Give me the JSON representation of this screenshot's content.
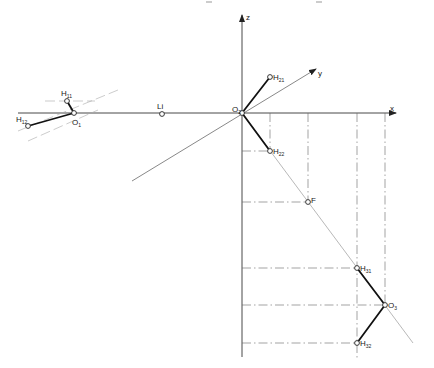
{
  "figure": {
    "type": "descriptive-geometry-construction",
    "axes": {
      "x": {
        "label": "x"
      },
      "y": {
        "label": "y"
      },
      "z": {
        "label": "z"
      }
    },
    "points": [
      {
        "id": "O2",
        "label": "O",
        "sub": "2",
        "x": 242,
        "y": 113
      },
      {
        "id": "H21",
        "label": "H",
        "sub": "21",
        "x": 270,
        "y": 77
      },
      {
        "id": "H22",
        "label": "H",
        "sub": "22",
        "x": 270,
        "y": 151
      },
      {
        "id": "F",
        "label": "F",
        "sub": "",
        "x": 308,
        "y": 202
      },
      {
        "id": "H31",
        "label": "H",
        "sub": "31",
        "x": 357,
        "y": 268
      },
      {
        "id": "O3",
        "label": "O",
        "sub": "3",
        "x": 385,
        "y": 305
      },
      {
        "id": "H32",
        "label": "H",
        "sub": "32",
        "x": 357,
        "y": 343
      },
      {
        "id": "Li",
        "label": "Li",
        "sub": "",
        "x": 162,
        "y": 114
      },
      {
        "id": "O1",
        "label": "O",
        "sub": "1",
        "x": 74,
        "y": 113
      },
      {
        "id": "H11",
        "label": "H",
        "sub": "11",
        "x": 67,
        "y": 101
      },
      {
        "id": "H12",
        "label": "H",
        "sub": "12",
        "x": 28,
        "y": 126
      }
    ]
  }
}
